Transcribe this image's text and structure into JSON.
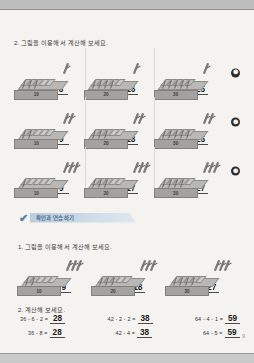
{
  "worksheet": {
    "section_2_heading": "2. 그림을 이용해서 계산해 보세요.",
    "rows": [
      {
        "marker": "❶",
        "cells": [
          {
            "slab_label": "10",
            "cubes": 5,
            "struck": 3,
            "sticks": 1,
            "expr": "11 - 3 =",
            "answer": "8"
          },
          {
            "slab_label": "20",
            "cubes": 5,
            "struck": 4,
            "sticks": 1,
            "expr": "21 - 5 =",
            "answer": "16"
          },
          {
            "slab_label": "30",
            "cubes": 5,
            "struck": 5,
            "sticks": 1,
            "expr": "31 - 6 =",
            "answer": "25"
          }
        ]
      },
      {
        "marker": "❷",
        "cells": [
          {
            "slab_label": "10",
            "cubes": 5,
            "struck": 2,
            "sticks": 2,
            "expr": "12 - 3 =",
            "answer": "9"
          },
          {
            "slab_label": "20",
            "cubes": 5,
            "struck": 3,
            "sticks": 2,
            "expr": "22 - 4 =",
            "answer": "18"
          },
          {
            "slab_label": "30",
            "cubes": 5,
            "struck": 5,
            "sticks": 2,
            "expr": "32 - 7 =",
            "answer": "25"
          }
        ]
      },
      {
        "marker": "❸",
        "cells": [
          {
            "slab_label": "10",
            "cubes": 5,
            "struck": 1,
            "sticks": 3,
            "expr": "13 - 4 =",
            "answer": "9"
          },
          {
            "slab_label": "20",
            "cubes": 5,
            "struck": 3,
            "sticks": 3,
            "expr": "23 - 6 =",
            "answer": "17"
          },
          {
            "slab_label": "30",
            "cubes": 5,
            "struck": 4,
            "sticks": 3,
            "expr": "33 - 6 =",
            "answer": "27"
          }
        ]
      }
    ]
  },
  "banner": {
    "mark": "✔",
    "title": "확인과 연습하기"
  },
  "practice": {
    "heading": "1. 그림을 이용해서 계산해 보세요.",
    "cells": [
      {
        "slab_label": "10",
        "cubes": 5,
        "struck": 2,
        "sticks": 3,
        "expr": "14 - 5 =",
        "answer": "9"
      },
      {
        "slab_label": "20",
        "cubes": 5,
        "struck": 3,
        "sticks": 3,
        "expr": "24 - 6 =",
        "answer": "18"
      },
      {
        "slab_label": "30",
        "cubes": 5,
        "struck": 4,
        "sticks": 3,
        "expr": "34 - 7 =",
        "answer": "27"
      }
    ]
  },
  "calculation": {
    "heading": "2. 계산해 보세요.",
    "columns": [
      {
        "items": [
          {
            "expr": "36 - 6 - 2 =",
            "answer": "28"
          },
          {
            "expr": "36 - 8 =",
            "answer": "28"
          }
        ]
      },
      {
        "items": [
          {
            "expr": "42 - 2 - 2 =",
            "answer": "38"
          },
          {
            "expr": "42 - 4 =",
            "answer": "38"
          }
        ]
      },
      {
        "items": [
          {
            "expr": "64 - 4 - 1 =",
            "answer": "59"
          },
          {
            "expr": "64 - 5 =",
            "answer": "59"
          }
        ]
      }
    ]
  },
  "footer": {
    "page_number": "9"
  }
}
